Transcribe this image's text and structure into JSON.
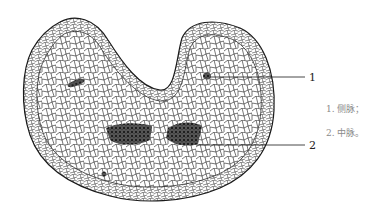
{
  "figure": {
    "type": "botanical cross-section illustration",
    "colors": {
      "line": "#1a1a1a",
      "bundle": "#2a2a2a",
      "legend_text": "#8a8a8a",
      "background": "#ffffff"
    }
  },
  "labels": [
    {
      "number": "1",
      "target": "lateral vein"
    },
    {
      "number": "2",
      "target": "midvein"
    }
  ],
  "legend": {
    "items": [
      {
        "text": "1. 侧脉；"
      },
      {
        "text": "2. 中脉。"
      }
    ]
  }
}
